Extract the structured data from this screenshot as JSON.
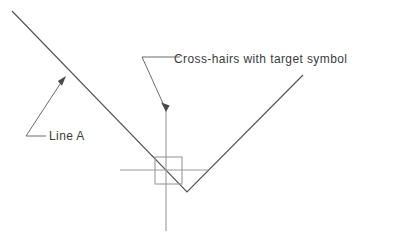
{
  "figure": {
    "background_color": "#ffffff",
    "annotations": [
      {
        "id": "crosshair-annotation",
        "label": "Cross-hairs with target symbol",
        "text_x": 174,
        "text_y": 63,
        "leader_path": "M 180 57 L 142 57 L 166 110",
        "arrow_points": "166,112 161.2,102.6 169.6,105.4",
        "color": "#6a6a6a"
      },
      {
        "id": "line-a-annotation",
        "label": "Line A",
        "text_x": 49,
        "text_y": 140,
        "leader_path": "M 46 136 L 26 136 L 64 78",
        "arrow_points": "66,76 62.0,85.8 57.8,81.0",
        "color": "#6a6a6a"
      }
    ],
    "geometry": {
      "line_a": {
        "name": "Line A",
        "path": "M 12 11 L 187 192 L 303 75",
        "color": "#555555",
        "width": 1.2
      },
      "crosshair": {
        "name": "cross-hairs",
        "horizontal": {
          "x1": 120,
          "y1": 170,
          "x2": 208,
          "y2": 170
        },
        "vertical": {
          "x1": 166,
          "y1": 110,
          "x2": 166,
          "y2": 231
        },
        "color": "#9a9a9a",
        "width": 1.1
      },
      "target_square": {
        "name": "target symbol",
        "x": 155,
        "y": 157,
        "size": 27,
        "color": "#9a9a9a",
        "width": 1.1
      }
    }
  }
}
